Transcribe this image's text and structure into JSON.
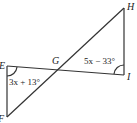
{
  "diagram": {
    "type": "geometry",
    "points": {
      "E": {
        "label": "E",
        "x": 7,
        "y": 66
      },
      "F": {
        "label": "F",
        "x": 7,
        "y": 117
      },
      "G": {
        "label": "G",
        "x": 58,
        "y": 70
      },
      "H": {
        "label": "H",
        "x": 124,
        "y": 8
      },
      "I": {
        "label": "I",
        "x": 124,
        "y": 75
      }
    },
    "segments": [
      "EF",
      "EI",
      "FH",
      "HI"
    ],
    "angles": [
      {
        "vertex": "E",
        "expression": "3x + 13°"
      },
      {
        "vertex": "I",
        "expression": "5x − 33°"
      }
    ],
    "stroke_color": "#333333"
  }
}
